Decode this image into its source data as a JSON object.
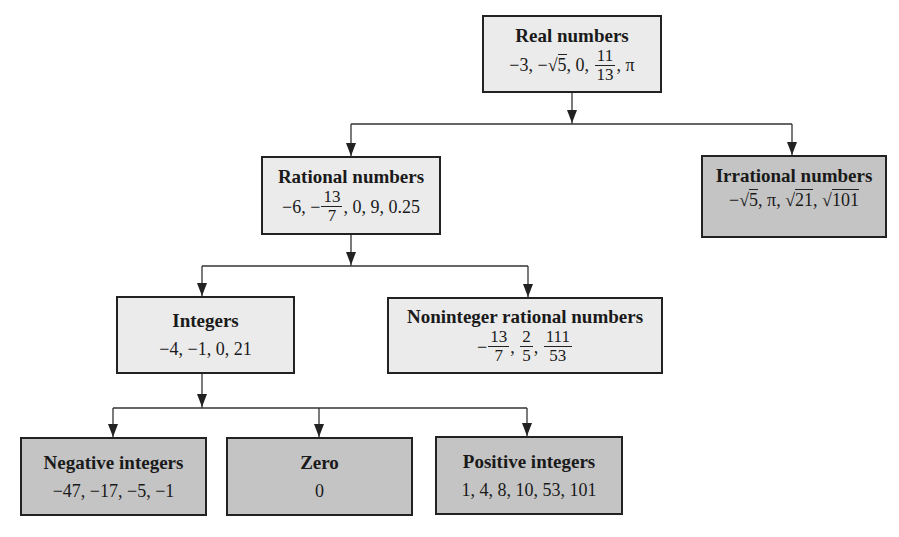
{
  "diagram": {
    "nodes": {
      "real": {
        "title": "Real numbers",
        "examples": [
          "−3",
          "−√5",
          "0",
          "11/13",
          "π"
        ],
        "parts": {
          "a": "−3, ",
          "b_sign": "−",
          "b_rad": "5",
          "c": ", 0, ",
          "frac_num": "11",
          "frac_den": "13",
          "d": ", π"
        }
      },
      "rational": {
        "title": "Rational numbers",
        "examples": [
          "−6",
          "−13/7",
          "0",
          "9",
          "0.25"
        ],
        "parts": {
          "a": "−6, −",
          "frac_num": "13",
          "frac_den": "7",
          "b": ", 0, 9, 0.25"
        }
      },
      "irrational": {
        "title": "Irrational numbers",
        "examples": [
          "−√5",
          "π",
          "√21",
          "√101"
        ],
        "parts": {
          "a": "−",
          "rad1": "5",
          "b": ", π, ",
          "rad2": "21",
          "c": ", ",
          "rad3": "101"
        }
      },
      "integers": {
        "title": "Integers",
        "examples": [
          "−4",
          "−1",
          "0",
          "21"
        ],
        "text": "−4, −1, 0, 21"
      },
      "noninteger": {
        "title": "Noninteger rational numbers",
        "examples": [
          "−13/7",
          "2/5",
          "111/53"
        ],
        "parts": {
          "a": "−",
          "f1_num": "13",
          "f1_den": "7",
          "sep1": ", ",
          "f2_num": "2",
          "f2_den": "5",
          "sep2": ", ",
          "f3_num": "111",
          "f3_den": "53"
        }
      },
      "negative": {
        "title": "Negative integers",
        "examples": [
          "−47",
          "−17",
          "−5",
          "−1"
        ],
        "text": "−47, −17, −5, −1"
      },
      "zero": {
        "title": "Zero",
        "examples": [
          "0"
        ],
        "text": "0"
      },
      "positive": {
        "title": "Positive integers",
        "examples": [
          "1",
          "4",
          "8",
          "10",
          "53",
          "101"
        ],
        "text": "1, 4, 8, 10, 53, 101"
      }
    },
    "edges": [
      {
        "from": "Real numbers",
        "to": "Rational numbers"
      },
      {
        "from": "Real numbers",
        "to": "Irrational numbers"
      },
      {
        "from": "Rational numbers",
        "to": "Integers"
      },
      {
        "from": "Rational numbers",
        "to": "Noninteger rational numbers"
      },
      {
        "from": "Integers",
        "to": "Negative integers"
      },
      {
        "from": "Integers",
        "to": "Zero"
      },
      {
        "from": "Integers",
        "to": "Positive integers"
      }
    ],
    "colors": {
      "light_box": "#ebebeb",
      "dark_box": "#c4c4c4",
      "border": "#222222"
    }
  }
}
